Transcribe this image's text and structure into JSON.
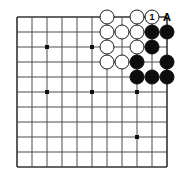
{
  "figure": {
    "kind": "go-board-diagram",
    "colors": {
      "background": "#ffffff",
      "grid_line": "#4d4d4d",
      "border_line": "#333333",
      "black_stone": "#0d0d0d",
      "white_stone": "#ffffff",
      "stone_outline": "#1a1a1a",
      "star_point": "#111111",
      "label_text": "#000000"
    }
  },
  "board": {
    "columns": 11,
    "rows": 11,
    "origin_x": 17,
    "origin_y": 17,
    "spacing": 15,
    "line_width": 1,
    "border_width": 1.6,
    "star_points": [
      {
        "col": 2,
        "row": 2
      },
      {
        "col": 5,
        "row": 2
      },
      {
        "col": 2,
        "row": 5
      },
      {
        "col": 5,
        "row": 5
      },
      {
        "col": 8,
        "row": 5
      },
      {
        "col": 8,
        "row": 8
      }
    ]
  },
  "stones": [
    {
      "col": 6,
      "row": 0,
      "color": "white",
      "label": ""
    },
    {
      "col": 8,
      "row": 0,
      "color": "white",
      "label": ""
    },
    {
      "col": 9,
      "row": 0,
      "color": "white",
      "label": "1"
    },
    {
      "col": 6,
      "row": 1,
      "color": "white",
      "label": ""
    },
    {
      "col": 7,
      "row": 1,
      "color": "white",
      "label": ""
    },
    {
      "col": 8,
      "row": 1,
      "color": "white",
      "label": ""
    },
    {
      "col": 9,
      "row": 1,
      "color": "black",
      "label": ""
    },
    {
      "col": 10,
      "row": 1,
      "color": "black",
      "label": ""
    },
    {
      "col": 6,
      "row": 2,
      "color": "white",
      "label": ""
    },
    {
      "col": 8,
      "row": 2,
      "color": "white",
      "label": ""
    },
    {
      "col": 9,
      "row": 2,
      "color": "black",
      "label": ""
    },
    {
      "col": 6,
      "row": 3,
      "color": "white",
      "label": ""
    },
    {
      "col": 7,
      "row": 3,
      "color": "white",
      "label": ""
    },
    {
      "col": 8,
      "row": 3,
      "color": "black",
      "label": ""
    },
    {
      "col": 10,
      "row": 3,
      "color": "black",
      "label": ""
    },
    {
      "col": 8,
      "row": 4,
      "color": "black",
      "label": ""
    },
    {
      "col": 9,
      "row": 4,
      "color": "black",
      "label": ""
    },
    {
      "col": 10,
      "row": 4,
      "color": "black",
      "label": ""
    }
  ],
  "point_labels": [
    {
      "col": 10,
      "row": 0,
      "text": "A"
    }
  ],
  "move_markers": [
    {
      "number": "1",
      "col": 9,
      "row": 0,
      "color": "white"
    }
  ]
}
